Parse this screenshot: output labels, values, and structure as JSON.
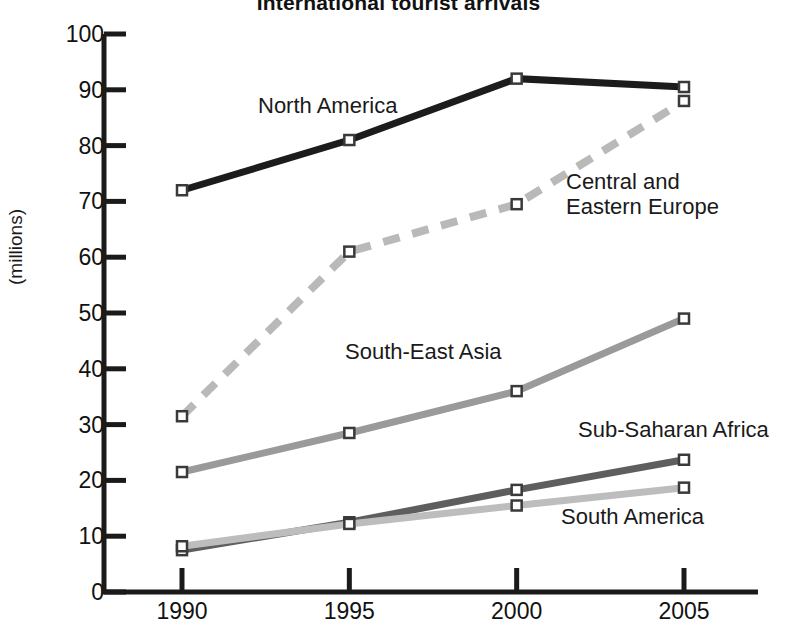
{
  "chart_data": {
    "type": "line",
    "title": "International tourist arrivals",
    "xlabel": "",
    "ylabel": "(millions)",
    "categories": [
      "1990",
      "1995",
      "2000",
      "2005"
    ],
    "x": [
      1990,
      1995,
      2000,
      2005
    ],
    "ylim": [
      0,
      100
    ],
    "yticks": [
      0,
      10,
      20,
      30,
      40,
      50,
      60,
      70,
      80,
      90,
      100
    ],
    "grid": false,
    "legend_position": "inline-labels",
    "markers": "square",
    "series": [
      {
        "name": "North America",
        "values": [
          72,
          81,
          92,
          90.5
        ],
        "color": "#1c1c1c",
        "style": "solid",
        "width": 7
      },
      {
        "name": "Central and\nEastern Europe",
        "values": [
          31.5,
          61,
          69.5,
          88
        ],
        "color": "#b9b9b9",
        "style": "dashed",
        "width": 8
      },
      {
        "name": "South-East Asia",
        "values": [
          21.5,
          28.5,
          36,
          49
        ],
        "color": "#9a9a9a",
        "style": "solid",
        "width": 7
      },
      {
        "name": "Sub-Saharan Africa",
        "values": [
          7.5,
          12.5,
          18.3,
          23.7
        ],
        "color": "#5e5e5e",
        "style": "solid",
        "width": 7
      },
      {
        "name": "South America",
        "values": [
          8.2,
          12.2,
          15.5,
          18.7
        ],
        "color": "#bdbdbd",
        "style": "solid",
        "width": 7
      }
    ],
    "annotations": [
      {
        "text": "North America",
        "series": "North America"
      },
      {
        "text": "Central and\nEastern Europe",
        "series": "Central and Eastern Europe"
      },
      {
        "text": "South-East Asia",
        "series": "South-East Asia"
      },
      {
        "text": "Sub-Saharan Africa",
        "series": "Sub-Saharan Africa"
      },
      {
        "text": "South America",
        "series": "South America"
      }
    ]
  },
  "axis": {
    "line_color": "#1a1a1a",
    "y_label": "(millions)",
    "y_ticks": [
      "100",
      "90",
      "80",
      "70",
      "60",
      "50",
      "40",
      "30",
      "20",
      "10",
      "0"
    ],
    "x_ticks": [
      "1990",
      "1995",
      "2000",
      "2005"
    ]
  },
  "labels": {
    "north_america": "North America",
    "central_eastern_europe_line1": "Central and",
    "central_eastern_europe_line2": "Eastern Europe",
    "south_east_asia": "South-East Asia",
    "sub_saharan_africa": "Sub-Saharan Africa",
    "south_america": "South America"
  },
  "title": "International tourist arrivals"
}
